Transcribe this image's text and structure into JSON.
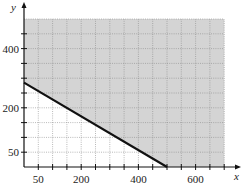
{
  "chart_data": {
    "type": "line",
    "title": "",
    "xlabel": "x",
    "ylabel": "y",
    "xlim": [
      0,
      700
    ],
    "ylim": [
      0,
      500
    ],
    "grid": true,
    "x_ticks": [
      50,
      100,
      150,
      200,
      250,
      300,
      350,
      400,
      450,
      500,
      550,
      600,
      650,
      700
    ],
    "x_tick_labels": [
      {
        "value": 50,
        "label": "50"
      },
      {
        "value": 200,
        "label": "200"
      },
      {
        "value": 400,
        "label": "400"
      },
      {
        "value": 600,
        "label": "600"
      }
    ],
    "y_ticks": [
      50,
      100,
      150,
      200,
      250,
      300,
      350,
      400,
      450
    ],
    "y_tick_labels": [
      {
        "value": 50,
        "label": "50"
      },
      {
        "value": 200,
        "label": "200"
      },
      {
        "value": 400,
        "label": "400"
      }
    ],
    "series": [
      {
        "name": "boundary line",
        "x": [
          0,
          500
        ],
        "y": [
          285,
          0
        ],
        "style": "solid",
        "color": "#111111"
      }
    ],
    "shaded_region": {
      "description": "feasible region above the boundary line",
      "polygon": [
        [
          0,
          285
        ],
        [
          0,
          500
        ],
        [
          700,
          500
        ],
        [
          700,
          0
        ],
        [
          500,
          0
        ]
      ],
      "color": "#d4d4d4"
    }
  },
  "colors": {
    "shade": "#d4d4d4",
    "grid": "#8a8a8a",
    "axis": "#111111",
    "line": "#111111"
  }
}
